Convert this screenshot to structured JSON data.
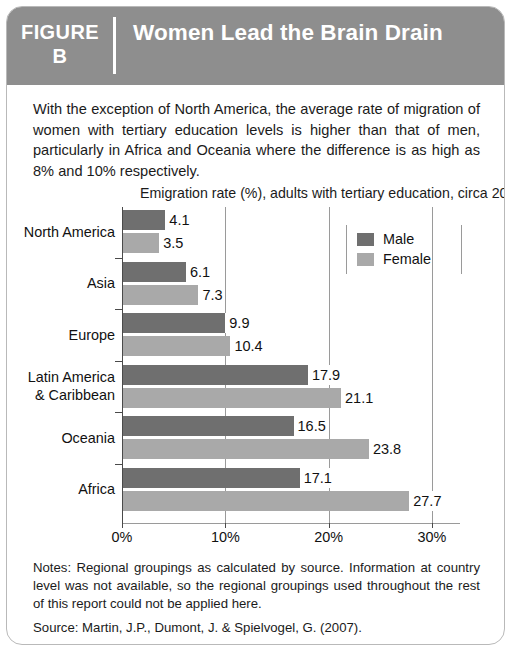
{
  "figure": {
    "tag_line1": "FIGURE",
    "tag_line2": "B",
    "title": "Women Lead the Brain Drain",
    "header_color": "#8e8e8e",
    "intro": "With the exception of North America, the average rate of migration of women with tertiary education levels is higher than that of men, particularly in Africa and Oceania where the difference is as high as 8% and 10% respectively.",
    "notes": "Notes: Regional groupings as calculated by source. Information at country level was not available, so the regional groupings used throughout the rest of this report could not be applied here.",
    "source": "Source: Martin, J.P., Dumont, J. & Spielvogel, G. (2007)."
  },
  "chart_data": {
    "type": "bar",
    "orientation": "horizontal",
    "title": "Emigration rate (%), adults with tertiary education, circa 2000",
    "xlabel": "",
    "ylabel": "",
    "xlim": [
      0,
      30
    ],
    "xticks": [
      0,
      10,
      20,
      30
    ],
    "xtick_labels": [
      "0%",
      "10%",
      "20%",
      "30%"
    ],
    "grid": true,
    "legend_position": "top-right",
    "categories": [
      "North America",
      "Asia",
      "Europe",
      "Latin America & Caribbean",
      "Oceania",
      "Africa"
    ],
    "category_lines": [
      [
        "North America"
      ],
      [
        "Asia"
      ],
      [
        "Europe"
      ],
      [
        "Latin America",
        "& Caribbean"
      ],
      [
        "Oceania"
      ],
      [
        "Africa"
      ]
    ],
    "series": [
      {
        "name": "Male",
        "color": "#6f6f6f",
        "values": [
          4.1,
          6.1,
          9.9,
          17.9,
          16.5,
          17.1
        ],
        "labels": [
          "4.1",
          "6.1",
          "9.9",
          "17.9",
          "16.5",
          "17.1"
        ]
      },
      {
        "name": "Female",
        "color": "#a9a9a9",
        "values": [
          3.5,
          7.3,
          10.4,
          21.1,
          23.8,
          27.7
        ],
        "labels": [
          "3.5",
          "7.3",
          "10.4",
          "21.1",
          "23.8",
          "27.7"
        ]
      }
    ]
  }
}
